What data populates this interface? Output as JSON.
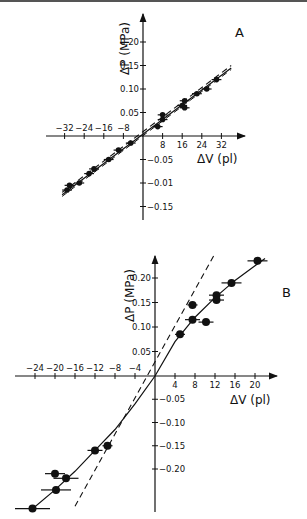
{
  "chart_data": [
    {
      "panel": "A",
      "type": "scatter",
      "title": "A",
      "xlabel": "ΔV (pl)",
      "ylabel": "ΔP (MPa)",
      "x_ticks": [
        -32,
        -24,
        -16,
        -8,
        8,
        16,
        24,
        32
      ],
      "x_tick_labels": [
        "-32",
        "-24",
        "-16",
        "-8",
        "8",
        "16",
        "24",
        "32"
      ],
      "y_ticks": [
        0.2,
        0.15,
        0.1,
        0.05,
        -0.05,
        -0.1,
        -0.15
      ],
      "y_tick_labels": [
        "0.20",
        "0.15",
        "0.10",
        "0.05",
        "-0.05",
        "-0.01",
        "-0.15"
      ],
      "xlim": [
        -36,
        38
      ],
      "ylim": [
        -0.17,
        0.25
      ],
      "grid": false,
      "series": [
        {
          "name": "data points (with error bars)",
          "style": "filled circles",
          "x": [
            -31,
            -30,
            -26,
            -22,
            -20,
            -14,
            -10,
            -5,
            6,
            8,
            8,
            16,
            17,
            17,
            22,
            26,
            30
          ],
          "y": [
            -0.115,
            -0.105,
            -0.1,
            -0.08,
            -0.07,
            -0.05,
            -0.03,
            -0.015,
            0.02,
            0.035,
            0.045,
            0.065,
            0.075,
            0.06,
            0.09,
            0.1,
            0.12
          ]
        },
        {
          "name": "solid fit line",
          "style": "solid",
          "x": [
            -33,
            36
          ],
          "y": [
            -0.125,
            0.145
          ]
        },
        {
          "name": "dashed reference lines",
          "style": "dashed",
          "x": [
            -33,
            36
          ],
          "y": [
            -0.12,
            0.15
          ]
        }
      ]
    },
    {
      "panel": "B",
      "type": "scatter",
      "title": "B",
      "xlabel": "ΔV (pl)",
      "ylabel": "ΔP (MPa)",
      "x_ticks": [
        -24,
        -20,
        -16,
        -12,
        -8,
        -4,
        4,
        8,
        12,
        16,
        20
      ],
      "x_tick_labels": [
        "-24",
        "-20",
        "-16",
        "-12",
        "-8",
        "-4",
        "4",
        "8",
        "12",
        "16",
        "20"
      ],
      "y_ticks": [
        0.2,
        0.15,
        0.1,
        0.05,
        -0.05,
        -0.1,
        -0.15,
        -0.2
      ],
      "y_tick_labels": [
        "0.20",
        "0.15",
        "0.10",
        "0.05",
        "-0.05",
        "-0.10",
        "-0.15",
        "-0.20"
      ],
      "xlim": [
        -29,
        24
      ],
      "ylim": [
        -0.3,
        0.25
      ],
      "grid": false,
      "series": [
        {
          "name": "data points (with error bars)",
          "style": "filled circles",
          "x": [
            -24.5,
            -19.8,
            -20,
            -17.8,
            -12,
            -9.5,
            5,
            7.5,
            7.5,
            10.2,
            12.3,
            12.3,
            15.3,
            20.5
          ],
          "y": [
            -0.285,
            -0.245,
            -0.21,
            -0.22,
            -0.16,
            -0.15,
            0.085,
            0.145,
            0.115,
            0.11,
            0.165,
            0.155,
            0.19,
            0.235
          ],
          "x_error": [
            3.5,
            3,
            2,
            2.5,
            1.5,
            1,
            1,
            1,
            1.5,
            1.5,
            1.5,
            1.5,
            2,
            2
          ]
        },
        {
          "name": "solid fitted curve",
          "style": "solid",
          "x": [
            -25,
            -20,
            -16,
            -12,
            -8,
            -4,
            0,
            4,
            8,
            12,
            16,
            20,
            22
          ],
          "y": [
            -0.29,
            -0.245,
            -0.205,
            -0.16,
            -0.115,
            -0.06,
            0.0,
            0.07,
            0.12,
            0.16,
            0.195,
            0.225,
            0.24
          ]
        },
        {
          "name": "dashed linear reference",
          "style": "dashed",
          "x": [
            -16,
            12
          ],
          "y": [
            -0.28,
            0.25
          ]
        }
      ]
    }
  ],
  "panels": {
    "a": {
      "label": "A",
      "xlabel": "ΔV (pl)",
      "ylabel": "ΔP (MPa)",
      "xticks": [
        "−32",
        "−24",
        "−16",
        "−8",
        "8",
        "16",
        "24",
        "32"
      ],
      "yticks": [
        "0.20",
        "0.15",
        "0.10",
        "0.05",
        "−0.05",
        "−0.01",
        "−0.15"
      ]
    },
    "b": {
      "label": "B",
      "xlabel": "ΔV (pl)",
      "ylabel": "ΔP (MPa)",
      "xticks": [
        "−24",
        "−20",
        "−16",
        "−12",
        "−8",
        "−4",
        "4",
        "8",
        "12",
        "16",
        "20"
      ],
      "yticks": [
        "0.20",
        "0.15",
        "0.10",
        "0.05",
        "−0.05",
        "−0.10",
        "−0.15",
        "−0.20"
      ]
    }
  }
}
